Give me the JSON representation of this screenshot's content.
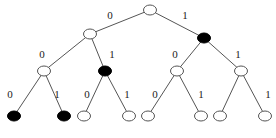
{
  "diagram": {
    "type": "binary-tree",
    "colors": {
      "filled": "#000000",
      "empty": "#ffffff",
      "stroke": "#555555"
    },
    "nodes": [
      {
        "id": "root",
        "x": 150,
        "y": 10,
        "filled": false
      },
      {
        "id": "n0",
        "x": 90,
        "y": 34,
        "filled": false
      },
      {
        "id": "n1",
        "x": 204,
        "y": 38,
        "filled": true
      },
      {
        "id": "n00",
        "x": 44,
        "y": 71,
        "filled": false
      },
      {
        "id": "n01",
        "x": 105,
        "y": 71,
        "filled": true
      },
      {
        "id": "n10",
        "x": 177,
        "y": 71,
        "filled": false
      },
      {
        "id": "n11",
        "x": 241,
        "y": 71,
        "filled": false
      },
      {
        "id": "n000",
        "x": 14,
        "y": 116,
        "filled": true
      },
      {
        "id": "n001",
        "x": 64,
        "y": 116,
        "filled": true
      },
      {
        "id": "n010",
        "x": 84,
        "y": 116,
        "filled": false
      },
      {
        "id": "n011",
        "x": 129,
        "y": 116,
        "filled": false
      },
      {
        "id": "n100",
        "x": 148,
        "y": 116,
        "filled": false
      },
      {
        "id": "n101",
        "x": 201,
        "y": 116,
        "filled": false
      },
      {
        "id": "n110",
        "x": 220,
        "y": 116,
        "filled": false
      },
      {
        "id": "n111",
        "x": 265,
        "y": 116,
        "filled": false
      }
    ],
    "edges": [
      {
        "from": "root",
        "to": "n0",
        "label": "0",
        "lx": 110,
        "ly": 19
      },
      {
        "from": "root",
        "to": "n1",
        "label": "1",
        "lx": 185,
        "ly": 19
      },
      {
        "from": "n0",
        "to": "n00",
        "label": "0",
        "lx": 42,
        "ly": 58
      },
      {
        "from": "n0",
        "to": "n01",
        "label": "1",
        "lx": 112,
        "ly": 58
      },
      {
        "from": "n1",
        "to": "n10",
        "label": "0",
        "lx": 175,
        "ly": 58
      },
      {
        "from": "n1",
        "to": "n11",
        "label": "1",
        "lx": 238,
        "ly": 58
      },
      {
        "from": "n00",
        "to": "n000",
        "label": "0",
        "lx": 10,
        "ly": 98
      },
      {
        "from": "n00",
        "to": "n001",
        "label": "1",
        "lx": 57,
        "ly": 98
      },
      {
        "from": "n01",
        "to": "n010",
        "label": "0",
        "lx": 87,
        "ly": 98
      },
      {
        "from": "n01",
        "to": "n011",
        "label": "1",
        "lx": 127,
        "ly": 98
      },
      {
        "from": "n10",
        "to": "n100",
        "label": "0",
        "lx": 155,
        "ly": 98
      },
      {
        "from": "n10",
        "to": "n101",
        "label": "1",
        "lx": 201,
        "ly": 98
      },
      {
        "from": "n11",
        "to": "n110",
        "label": "",
        "lx": 0,
        "ly": 0
      },
      {
        "from": "n11",
        "to": "n111",
        "label": "1",
        "lx": 268,
        "ly": 98
      }
    ]
  }
}
